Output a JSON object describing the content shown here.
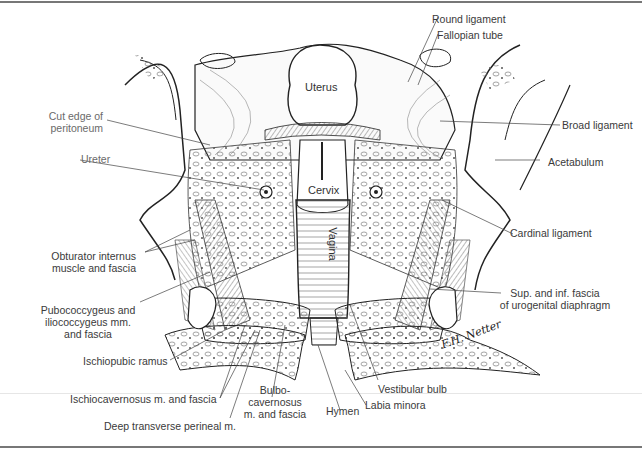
{
  "figure": {
    "signature": [
      "F.H. Netter",
      "Netter"
    ],
    "labels": {
      "round_ligament": "Round ligament",
      "fallopian_tube": "Fallopian tube",
      "uterus": "Uterus",
      "cut_edge_peritoneum": [
        "Cut edge of",
        "peritoneum"
      ],
      "broad_ligament": "Broad ligament",
      "ureter": "Ureter",
      "acetabulum": "Acetabulum",
      "cervix": "Cervix",
      "vagina": "Vagina",
      "cardinal_ligament": "Cardinal ligament",
      "obturator_internus": [
        "Obturator internus",
        "muscle and fascia"
      ],
      "sup_inf_fascia": [
        "Sup. and inf. fascia",
        "of urogenital diaphragm"
      ],
      "pubococcygeus": [
        "Pubococcygeus and",
        "iliococcygeus mm.",
        "and fascia"
      ],
      "ischiopubic_ramus": "Ischiopubic ramus",
      "vestibular_bulb": "Vestibular bulb",
      "ischiocavernosus": "Ischiocavernosus m. and fascia",
      "bulbocavernosus": [
        "Bulbo-",
        "cavernosus",
        "m. and fascia"
      ],
      "hymen": "Hymen",
      "labia_minora": "Labia minora",
      "deep_transverse_perineal": "Deep transverse perineal m."
    }
  }
}
